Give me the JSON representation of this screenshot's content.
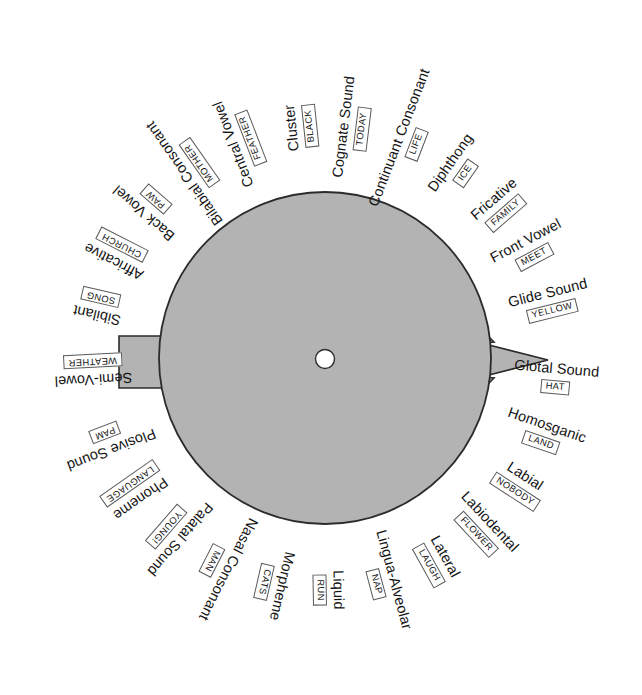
{
  "diagram": {
    "type": "phonics-word-wheel",
    "center_hub": "center-hole",
    "disc_color": "#b3b3b3",
    "outline_color": "#2b2b2b",
    "shape": "circle-with-right-arrow-and-left-tab",
    "center": {
      "x": 325,
      "y": 358,
      "radius": 166
    },
    "label_radius_title": 232,
    "segments": [
      {
        "index": 0,
        "angle": -96,
        "term": "Cluster",
        "example": "BLACK"
      },
      {
        "index": 1,
        "angle": -83,
        "term": "Cognate Sound",
        "example": "TODAY"
      },
      {
        "index": 2,
        "angle": -69,
        "term": "Continuant Consonant",
        "example": "LIFE"
      },
      {
        "index": 3,
        "angle": -55,
        "term": "Diphthong",
        "example": "ICE"
      },
      {
        "index": 4,
        "angle": -41,
        "term": "Fricative",
        "example": "FAMILY"
      },
      {
        "index": 5,
        "angle": -28,
        "term": "Front Vowel",
        "example": "MEET"
      },
      {
        "index": 6,
        "angle": -14,
        "term": "Glide Sound",
        "example": "YELLOW"
      },
      {
        "index": 7,
        "angle": 5,
        "term": "Glotal Sound",
        "example": "HAT"
      },
      {
        "index": 8,
        "angle": 19,
        "term": "Homosganic",
        "example": "LAND"
      },
      {
        "index": 9,
        "angle": 33,
        "term": "Labial",
        "example": "NOBODY"
      },
      {
        "index": 10,
        "angle": 47,
        "term": "Labiodental",
        "example": "FLOWER"
      },
      {
        "index": 11,
        "angle": 61,
        "term": "Lateral",
        "example": "LAUGH"
      },
      {
        "index": 12,
        "angle": 75,
        "term": "Lingua-Alveolar",
        "example": "NAP"
      },
      {
        "index": 13,
        "angle": 89,
        "term": "Liquid",
        "example": "RUN"
      },
      {
        "index": 14,
        "angle": 103,
        "term": "Morpheme",
        "example": "CATS"
      },
      {
        "index": 15,
        "angle": 117,
        "term": "Nasal Consonant",
        "example": "MAN"
      },
      {
        "index": 16,
        "angle": 131,
        "term": "Palatal Sound",
        "example": "YOUNG!"
      },
      {
        "index": 17,
        "angle": 145,
        "term": "Phoneme",
        "example": "LANGUAGE"
      },
      {
        "index": 18,
        "angle": 159,
        "term": "Plosive Sound",
        "example": "PAM"
      },
      {
        "index": 19,
        "angle": 177,
        "term": "Semi-Vowel",
        "example": "WEATHER"
      },
      {
        "index": 20,
        "angle": 193,
        "term": "Sibilant",
        "example": "SONG"
      },
      {
        "index": 21,
        "angle": 207,
        "term": "Affricative",
        "example": "CHURCH"
      },
      {
        "index": 22,
        "angle": 221,
        "term": "Back Vowel",
        "example": "PAW"
      },
      {
        "index": 23,
        "angle": 235,
        "term": "Bilabial Consonant",
        "example": "MOTHER"
      },
      {
        "index": 24,
        "angle": 249,
        "term": "Central Vowel",
        "example": "FEATHER"
      }
    ]
  }
}
